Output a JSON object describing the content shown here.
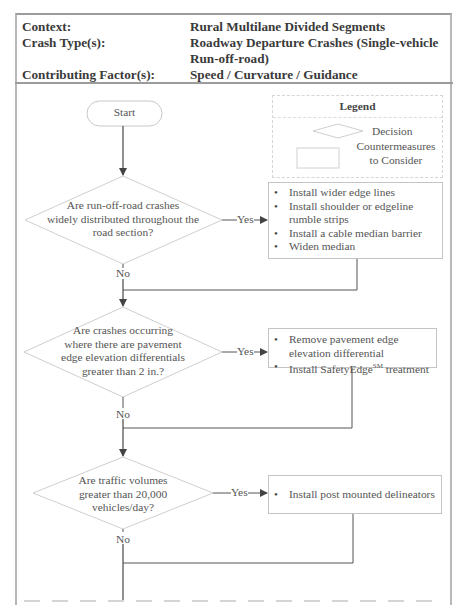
{
  "header": {
    "rows": [
      {
        "label": "Context:",
        "value": "Rural Multilane Divided Segments"
      },
      {
        "label": "Crash Type(s):",
        "value": "Roadway Departure Crashes (Single-vehicle Run-off-road)"
      },
      {
        "label": "Contributing Factor(s):",
        "value": "Speed / Curvature / Guidance"
      }
    ]
  },
  "legend": {
    "title": "Legend",
    "decision_label": "Decision",
    "countermeasure_label_line1": "Countermeasures",
    "countermeasure_label_line2": "to Consider"
  },
  "flow": {
    "start": "Start",
    "yes_label": "Yes",
    "no_label": "No",
    "decisions": [
      {
        "lines": [
          "Are run-off-road crashes",
          "widely distributed throughout the",
          "road section?"
        ],
        "countermeasures": [
          "Install wider edge lines",
          "Install shoulder or edgeline rumble strips",
          "Install a cable median barrier",
          "Widen median"
        ]
      },
      {
        "lines": [
          "Are crashes occurring",
          "where there are  pavement",
          "edge elevation differentials",
          "greater than 2 in.?"
        ],
        "countermeasures": [
          "Remove pavement edge elevation differential",
          "Install SafetyEdge"
        ],
        "countermeasure_2_superscript": "SM",
        "countermeasure_2_suffix": " treatment"
      },
      {
        "lines": [
          "Are traffic volumes",
          "greater than 20,000",
          "vehicles/day?"
        ],
        "countermeasures": [
          "Install post mounted delineators"
        ]
      }
    ]
  },
  "colors": {
    "frame": "#b8b8b8",
    "line": "#555555",
    "shape_border": "#c4c4c4",
    "text": "#555555"
  }
}
